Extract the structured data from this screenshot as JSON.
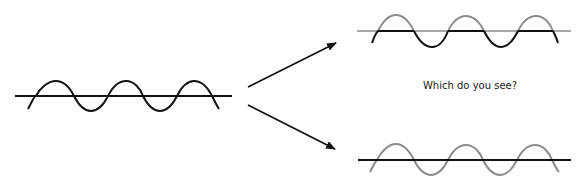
{
  "caption": "Which do you see?",
  "colors": {
    "black": "#111111",
    "gray": "#8c8c8c",
    "background": "#ffffff"
  },
  "panels": [
    {
      "name": "original",
      "description": "black sine wave crossing black horizontal line"
    },
    {
      "name": "option-top",
      "description": "wave dips below line (black) with gray crests above gray line"
    },
    {
      "name": "option-bottom",
      "description": "gray sine wave with black horizontal line over it"
    }
  ],
  "arrows": [
    {
      "from": "original",
      "to": "option-top"
    },
    {
      "from": "original",
      "to": "option-bottom"
    }
  ]
}
